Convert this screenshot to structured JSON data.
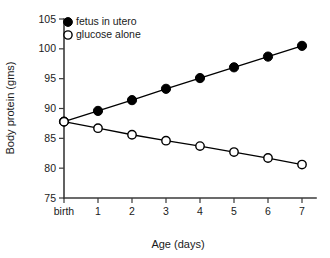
{
  "chart_data": {
    "type": "line",
    "title": "",
    "xlabel": "Age (days)",
    "ylabel": "Body protein (gms)",
    "x": [
      0,
      1,
      2,
      3,
      4,
      5,
      6,
      7
    ],
    "xtick_labels": [
      "birth",
      "1",
      "2",
      "3",
      "4",
      "5",
      "6",
      "7"
    ],
    "ytick_labels": [
      "105",
      "100",
      "95",
      "90",
      "85",
      "80",
      "75"
    ],
    "yticks": [
      105,
      100,
      95,
      90,
      85,
      80,
      75
    ],
    "xlim": [
      0,
      7
    ],
    "ylim": [
      75,
      105
    ],
    "grid": false,
    "legend_position": "top-left",
    "series": [
      {
        "name": "fetus in utero",
        "marker": "filled-circle",
        "color": "#000000",
        "values": [
          87.8,
          89.6,
          91.4,
          93.3,
          95.1,
          96.9,
          98.7,
          100.5
        ]
      },
      {
        "name": "glucose alone",
        "marker": "open-circle",
        "color": "#000000",
        "values": [
          87.8,
          86.7,
          85.6,
          84.6,
          83.7,
          82.7,
          81.7,
          80.6
        ]
      }
    ]
  },
  "legend": {
    "items": [
      {
        "label": "fetus in utero",
        "marker": "filled-circle"
      },
      {
        "label": "glucose alone",
        "marker": "open-circle"
      }
    ]
  }
}
